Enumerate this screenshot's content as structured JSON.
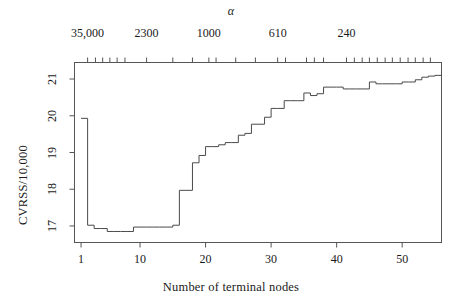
{
  "chart_data": {
    "type": "line",
    "subtype": "step",
    "title": "",
    "xlabel": "Number of terminal nodes",
    "ylabel": "CVRSS/10,000",
    "top_axis_label": "α",
    "xlim": [
      0,
      56
    ],
    "ylim": [
      16.55,
      21.45
    ],
    "grid": false,
    "legend": null,
    "x_tick_labels": [
      "1",
      "10",
      "20",
      "30",
      "40",
      "50"
    ],
    "x_tick_values": [
      1,
      10,
      20,
      30,
      40,
      50
    ],
    "y_tick_labels": [
      "17",
      "18",
      "19",
      "20",
      "21"
    ],
    "y_tick_values": [
      17,
      18,
      19,
      20,
      21
    ],
    "top_tick_labels": [
      "35,000",
      "2300",
      "1000",
      "610",
      "240"
    ],
    "top_tick_values": [
      2,
      11,
      20.5,
      31,
      41.5
    ],
    "top_minor_tick_values": [
      2,
      3.2,
      4.3,
      5.4,
      6.5,
      7.7,
      11,
      15,
      18,
      20.5,
      21.6,
      24.6,
      27.6,
      31,
      32.2,
      35.4,
      36.6,
      38,
      41.5,
      42.7,
      43.9,
      45,
      46.2,
      47.4,
      48.5,
      49.7,
      50.9,
      52,
      53.2,
      54.3
    ],
    "x": [
      1,
      2,
      3,
      4,
      5,
      6,
      7,
      8,
      9,
      10,
      11,
      12,
      13,
      14,
      15,
      16,
      17,
      18,
      19,
      20,
      21,
      22,
      23,
      24,
      25,
      26,
      27,
      28,
      29,
      30,
      31,
      32,
      33,
      34,
      35,
      36,
      37,
      38,
      39,
      40,
      41,
      42,
      43,
      44,
      45,
      46,
      47,
      48,
      49,
      50,
      51,
      52,
      53,
      54,
      55
    ],
    "values": [
      19.93,
      17.02,
      16.93,
      16.93,
      16.85,
      16.85,
      16.85,
      16.85,
      16.97,
      16.97,
      16.97,
      16.97,
      16.97,
      16.97,
      17.02,
      17.97,
      17.97,
      18.72,
      18.92,
      19.16,
      19.16,
      19.21,
      19.27,
      19.27,
      19.47,
      19.52,
      19.77,
      19.77,
      19.96,
      20.2,
      20.2,
      20.41,
      20.41,
      20.41,
      20.62,
      20.55,
      20.6,
      20.78,
      20.78,
      20.78,
      20.73,
      20.73,
      20.73,
      20.73,
      20.92,
      20.87,
      20.87,
      20.87,
      20.87,
      20.92,
      20.92,
      20.98,
      21.05,
      21.08,
      21.1
    ]
  }
}
